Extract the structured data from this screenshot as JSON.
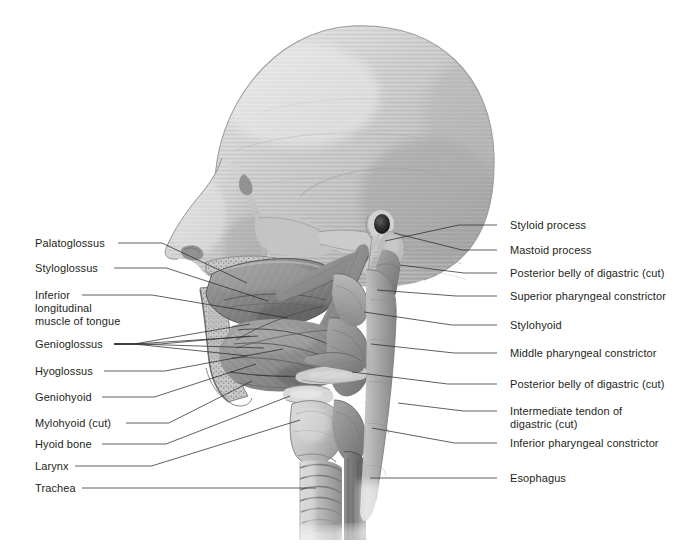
{
  "figure": {
    "background_color": "#ffffff",
    "ink_color": "#231f20",
    "leader_color": "#2b2b2b",
    "bone_light": "#cfcfcf",
    "bone_mid": "#b6b6b6",
    "bone_dark": "#8f8f8f",
    "muscle_mid": "#9a9a9a",
    "muscle_dark": "#6e6e6e"
  },
  "labels_left": [
    {
      "id": "palatoglossus",
      "text": "Palatoglossus",
      "lines": [
        "Palatoglossus"
      ],
      "x": 35,
      "y": 237,
      "leader_start_x": 118,
      "leader_y": 243,
      "target_x": 247,
      "target_y": 283
    },
    {
      "id": "styloglossus",
      "text": "Styloglossus",
      "lines": [
        "Styloglossus"
      ],
      "x": 35,
      "y": 262,
      "leader_start_x": 114,
      "leader_y": 268,
      "target_x": 268,
      "target_y": 301
    },
    {
      "id": "inferior-longitudinal-muscle-of-tongue",
      "text": "Inferior longitudinal muscle of tongue",
      "lines": [
        "Inferior",
        "longitudinal",
        "muscle of tongue"
      ],
      "x": 35,
      "y": 289,
      "leader_start_x": 82,
      "leader_y": 295,
      "target_x": 288,
      "target_y": 318
    },
    {
      "id": "genioglossus",
      "text": "Genioglossus",
      "lines": [
        "Genioglossus"
      ],
      "x": 35,
      "y": 338,
      "leader_start_x": 114,
      "leader_y": 344,
      "target_x": 250,
      "target_y": 336
    },
    {
      "id": "hyoglossus",
      "text": "Hyoglossus",
      "lines": [
        "Hyoglossus"
      ],
      "x": 35,
      "y": 365,
      "leader_start_x": 104,
      "leader_y": 371,
      "target_x": 283,
      "target_y": 349
    },
    {
      "id": "geniohyoid",
      "text": "Geniohyoid",
      "lines": [
        "Geniohyoid"
      ],
      "x": 35,
      "y": 391,
      "leader_start_x": 102,
      "leader_y": 397,
      "target_x": 256,
      "target_y": 364
    },
    {
      "id": "mylohyoid-cut",
      "text": "Mylohyoid (cut)",
      "lines": [
        "Mylohyoid (cut)"
      ],
      "x": 35,
      "y": 417,
      "leader_start_x": 126,
      "leader_y": 423,
      "target_x": 252,
      "target_y": 381
    },
    {
      "id": "hyoid-bone",
      "text": "Hyoid bone",
      "lines": [
        "Hyoid bone"
      ],
      "x": 35,
      "y": 438,
      "leader_start_x": 102,
      "leader_y": 444,
      "target_x": 290,
      "target_y": 396
    },
    {
      "id": "larynx",
      "text": "Larynx",
      "lines": [
        "Larynx"
      ],
      "x": 35,
      "y": 460,
      "leader_start_x": 75,
      "leader_y": 466,
      "target_x": 300,
      "target_y": 420
    },
    {
      "id": "trachea",
      "text": "Trachea",
      "lines": [
        "Trachea"
      ],
      "x": 35,
      "y": 482,
      "leader_start_x": 82,
      "leader_y": 488,
      "target_x": 316,
      "target_y": 488
    }
  ],
  "labels_right": [
    {
      "id": "styloid-process",
      "text": "Styloid process",
      "lines": [
        "Styloid process"
      ],
      "x": 510,
      "y": 219,
      "leader_start_x": 497,
      "leader_y": 225,
      "target_x": 385,
      "target_y": 241
    },
    {
      "id": "mastoid-process",
      "text": "Mastoid process",
      "lines": [
        "Mastoid process"
      ],
      "x": 510,
      "y": 244,
      "leader_start_x": 497,
      "leader_y": 250,
      "target_x": 394,
      "target_y": 233
    },
    {
      "id": "posterior-belly-digastric-cut-upper",
      "text": "Posterior belly of digastric (cut)",
      "lines": [
        "Posterior belly of digastric (cut)"
      ],
      "x": 510,
      "y": 267,
      "leader_start_x": 497,
      "leader_y": 273,
      "target_x": 400,
      "target_y": 265
    },
    {
      "id": "superior-pharyngeal-constrictor",
      "text": "Superior pharyngeal constrictor",
      "lines": [
        "Superior pharyngeal constrictor"
      ],
      "x": 510,
      "y": 290,
      "leader_start_x": 497,
      "leader_y": 296,
      "target_x": 377,
      "target_y": 290
    },
    {
      "id": "stylohyoid",
      "text": "Stylohyoid",
      "lines": [
        "Stylohyoid"
      ],
      "x": 510,
      "y": 319,
      "leader_start_x": 497,
      "leader_y": 325,
      "target_x": 364,
      "target_y": 312
    },
    {
      "id": "middle-pharyngeal-constrictor",
      "text": "Middle pharyngeal constrictor",
      "lines": [
        "Middle pharyngeal constrictor"
      ],
      "x": 510,
      "y": 347,
      "leader_start_x": 497,
      "leader_y": 353,
      "target_x": 371,
      "target_y": 344
    },
    {
      "id": "posterior-belly-digastric-cut-lower",
      "text": "Posterior belly of digastric (cut)",
      "lines": [
        "Posterior belly of digastric (cut)"
      ],
      "x": 510,
      "y": 378,
      "leader_start_x": 497,
      "leader_y": 384,
      "target_x": 352,
      "target_y": 372
    },
    {
      "id": "intermediate-tendon-of-digastric-cut",
      "text": "Intermediate tendon of digastric (cut)",
      "lines": [
        "Intermediate tendon of",
        "digastric (cut)"
      ],
      "x": 510,
      "y": 405,
      "leader_start_x": 497,
      "leader_y": 411,
      "target_x": 398,
      "target_y": 403
    },
    {
      "id": "inferior-pharyngeal-constrictor",
      "text": "Inferior pharyngeal constrictor",
      "lines": [
        "Inferior pharyngeal constrictor"
      ],
      "x": 510,
      "y": 437,
      "leader_start_x": 497,
      "leader_y": 443,
      "target_x": 372,
      "target_y": 428
    },
    {
      "id": "esophagus",
      "text": "Esophagus",
      "lines": [
        "Esophagus"
      ],
      "x": 510,
      "y": 472,
      "leader_start_x": 497,
      "leader_y": 478,
      "target_x": 370,
      "target_y": 478
    }
  ],
  "illustration": {
    "name": "lateral-head-neck-sagittal-illustration",
    "structures": [
      "cranium",
      "frontal bone",
      "nasal profile",
      "zygomatic arch",
      "mandible (cut)",
      "hard palate",
      "tongue",
      "soft palate",
      "hyoid bone",
      "larynx",
      "trachea",
      "esophagus",
      "styloid process",
      "mastoid process",
      "digastric muscle",
      "stylohyoid muscle",
      "pharyngeal constrictors",
      "cervical vertebrae"
    ]
  }
}
